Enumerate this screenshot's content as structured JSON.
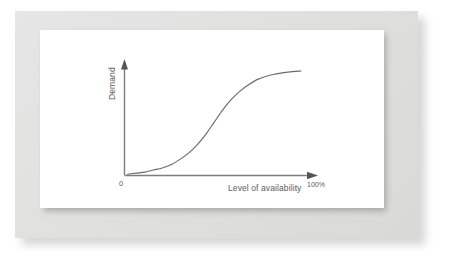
{
  "figure": {
    "frame_color": "#e2e2e2",
    "panel_color": "#ffffff",
    "shadow_color": "#9e9e9e"
  },
  "chart_data": {
    "type": "line",
    "title": "",
    "subtitle": "",
    "xlabel": "Level of availability",
    "ylabel": "Demand",
    "origin_label": "0",
    "x_max_label": "100%",
    "grid": false,
    "legend": null,
    "legend_position": "none",
    "axis_style": "arrow",
    "line_color": "#6b6b6b",
    "line_width": 1,
    "xlim": [
      0,
      100
    ],
    "ylim": [
      0,
      1
    ],
    "xtick_labels": [
      "0",
      "100%"
    ],
    "ytick_labels": [],
    "annotations": [],
    "series": [
      {
        "name": "Demand",
        "x": [
          0,
          5,
          10,
          15,
          20,
          25,
          30,
          35,
          40,
          45,
          50,
          55,
          60,
          65,
          70,
          75,
          80,
          85,
          90,
          95,
          100
        ],
        "y": [
          0.0,
          0.01,
          0.02,
          0.04,
          0.06,
          0.09,
          0.14,
          0.2,
          0.28,
          0.38,
          0.5,
          0.62,
          0.72,
          0.8,
          0.86,
          0.91,
          0.94,
          0.96,
          0.975,
          0.985,
          0.99
        ]
      }
    ]
  }
}
